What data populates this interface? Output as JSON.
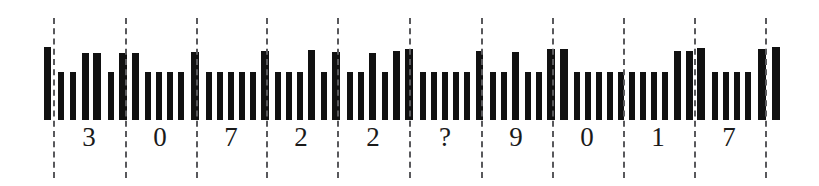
{
  "figure": {
    "kind": "barcode-segmentation-figure",
    "width": 819,
    "height": 186,
    "background_color": "#ffffff",
    "bar_color": "#111111",
    "dash_color": "#59595c",
    "digit_color": "#1a1a1a"
  },
  "digits": [
    {
      "label": "3",
      "cell_index": 0,
      "x": 89,
      "y": 124
    },
    {
      "label": "0",
      "cell_index": 1,
      "x": 160,
      "y": 124
    },
    {
      "label": "7",
      "cell_index": 2,
      "x": 231,
      "y": 124
    },
    {
      "label": "2",
      "cell_index": 3,
      "x": 301,
      "y": 124
    },
    {
      "label": "2",
      "cell_index": 4,
      "x": 373,
      "y": 124
    },
    {
      "label": "?",
      "cell_index": 5,
      "x": 445,
      "y": 124
    },
    {
      "label": "9",
      "cell_index": 6,
      "x": 516,
      "y": 124
    },
    {
      "label": "0",
      "cell_index": 7,
      "x": 587,
      "y": 124
    },
    {
      "label": "1",
      "cell_index": 8,
      "x": 658,
      "y": 124
    },
    {
      "label": "7",
      "cell_index": 9,
      "x": 729,
      "y": 124
    }
  ],
  "decoded_string": "307 22?901 7",
  "separators": [
    {
      "x": 53,
      "top": 18,
      "height": 160
    },
    {
      "x": 125,
      "top": 18,
      "height": 160
    },
    {
      "x": 196,
      "top": 18,
      "height": 160
    },
    {
      "x": 266,
      "top": 18,
      "height": 160
    },
    {
      "x": 337,
      "top": 18,
      "height": 160
    },
    {
      "x": 409,
      "top": 18,
      "height": 160
    },
    {
      "x": 481,
      "top": 18,
      "height": 160
    },
    {
      "x": 552,
      "top": 18,
      "height": 160
    },
    {
      "x": 623,
      "top": 18,
      "height": 160
    },
    {
      "x": 694,
      "top": 18,
      "height": 160
    },
    {
      "x": 765,
      "top": 18,
      "height": 160
    }
  ],
  "bars": [
    {
      "x": 44,
      "w": 7,
      "h": 73
    },
    {
      "x": 58,
      "w": 6,
      "h": 48
    },
    {
      "x": 70,
      "w": 6,
      "h": 48
    },
    {
      "x": 82,
      "w": 7,
      "h": 67
    },
    {
      "x": 93,
      "w": 8,
      "h": 67
    },
    {
      "x": 108,
      "w": 6,
      "h": 48
    },
    {
      "x": 119,
      "w": 8,
      "h": 67
    },
    {
      "x": 132,
      "w": 7,
      "h": 67
    },
    {
      "x": 145,
      "w": 6,
      "h": 48
    },
    {
      "x": 156,
      "w": 6,
      "h": 48
    },
    {
      "x": 167,
      "w": 6,
      "h": 48
    },
    {
      "x": 178,
      "w": 6,
      "h": 48
    },
    {
      "x": 191,
      "w": 8,
      "h": 68
    },
    {
      "x": 206,
      "w": 6,
      "h": 48
    },
    {
      "x": 217,
      "w": 6,
      "h": 48
    },
    {
      "x": 228,
      "w": 6,
      "h": 48
    },
    {
      "x": 239,
      "w": 6,
      "h": 48
    },
    {
      "x": 250,
      "w": 6,
      "h": 48
    },
    {
      "x": 261,
      "w": 8,
      "h": 69
    },
    {
      "x": 275,
      "w": 6,
      "h": 48
    },
    {
      "x": 286,
      "w": 6,
      "h": 48
    },
    {
      "x": 297,
      "w": 6,
      "h": 48
    },
    {
      "x": 308,
      "w": 7,
      "h": 70
    },
    {
      "x": 321,
      "w": 6,
      "h": 48
    },
    {
      "x": 332,
      "w": 8,
      "h": 68
    },
    {
      "x": 347,
      "w": 6,
      "h": 48
    },
    {
      "x": 358,
      "w": 6,
      "h": 48
    },
    {
      "x": 369,
      "w": 7,
      "h": 67
    },
    {
      "x": 382,
      "w": 6,
      "h": 48
    },
    {
      "x": 393,
      "w": 7,
      "h": 69
    },
    {
      "x": 405,
      "w": 8,
      "h": 71
    },
    {
      "x": 420,
      "w": 6,
      "h": 48
    },
    {
      "x": 431,
      "w": 6,
      "h": 48
    },
    {
      "x": 442,
      "w": 6,
      "h": 48
    },
    {
      "x": 453,
      "w": 6,
      "h": 48
    },
    {
      "x": 464,
      "w": 6,
      "h": 48
    },
    {
      "x": 476,
      "w": 7,
      "h": 69
    },
    {
      "x": 490,
      "w": 6,
      "h": 48
    },
    {
      "x": 501,
      "w": 6,
      "h": 48
    },
    {
      "x": 512,
      "w": 7,
      "h": 68
    },
    {
      "x": 525,
      "w": 6,
      "h": 48
    },
    {
      "x": 536,
      "w": 6,
      "h": 48
    },
    {
      "x": 547,
      "w": 8,
      "h": 71
    },
    {
      "x": 560,
      "w": 8,
      "h": 71
    },
    {
      "x": 574,
      "w": 6,
      "h": 48
    },
    {
      "x": 585,
      "w": 6,
      "h": 48
    },
    {
      "x": 596,
      "w": 6,
      "h": 48
    },
    {
      "x": 607,
      "w": 6,
      "h": 48
    },
    {
      "x": 618,
      "w": 6,
      "h": 48
    },
    {
      "x": 629,
      "w": 6,
      "h": 48
    },
    {
      "x": 640,
      "w": 6,
      "h": 48
    },
    {
      "x": 651,
      "w": 6,
      "h": 48
    },
    {
      "x": 662,
      "w": 6,
      "h": 48
    },
    {
      "x": 674,
      "w": 7,
      "h": 69
    },
    {
      "x": 686,
      "w": 7,
      "h": 69
    },
    {
      "x": 697,
      "w": 8,
      "h": 72
    },
    {
      "x": 712,
      "w": 6,
      "h": 48
    },
    {
      "x": 723,
      "w": 6,
      "h": 48
    },
    {
      "x": 734,
      "w": 6,
      "h": 48
    },
    {
      "x": 745,
      "w": 6,
      "h": 48
    },
    {
      "x": 758,
      "w": 8,
      "h": 71
    },
    {
      "x": 772,
      "w": 8,
      "h": 73
    }
  ]
}
